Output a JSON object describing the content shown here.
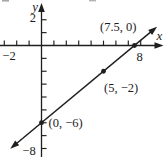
{
  "figure": {
    "tick_labels": {
      "y_pos2": "2",
      "x_neg2": "−2",
      "x_pos8": "8",
      "y_neg8": "−8"
    }
  },
  "chart_data": {
    "type": "line",
    "title": "",
    "xlabel": "x",
    "ylabel": "y",
    "x_range": [
      -3,
      8.9
    ],
    "y_range": [
      -8.5,
      2.5
    ],
    "x_tick_step": 1,
    "y_tick_step": 1,
    "labeled_x_ticks": [
      -2,
      8
    ],
    "labeled_y_ticks": [
      2,
      -8
    ],
    "grid": false,
    "line": {
      "slope": 0.8,
      "y_intercept": -6
    },
    "points": [
      {
        "x": 7.5,
        "y": 0,
        "label": "(7.5, 0)"
      },
      {
        "x": 5,
        "y": -2,
        "label": "(5, −2)"
      },
      {
        "x": 0,
        "y": -6,
        "label": "(0, −6)"
      }
    ]
  }
}
